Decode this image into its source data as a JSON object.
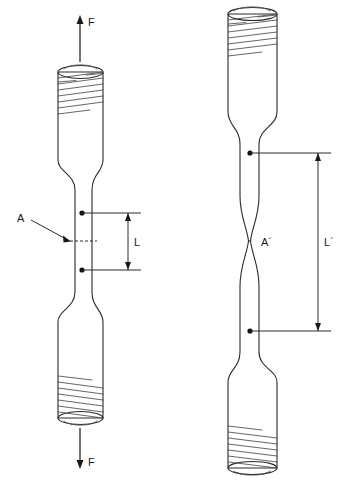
{
  "figure": {
    "background_color": "#ffffff",
    "line_color": "#2b2b2b",
    "width": 347,
    "height": 493
  },
  "specimen_left": {
    "name": "undeformed-specimen",
    "state": "original",
    "force_top_label": "F",
    "force_bottom_label": "F",
    "area_label": "A",
    "gauge_length_label": "L",
    "notes": "threaded ends top and bottom, uniform straight gauge section"
  },
  "specimen_right": {
    "name": "deformed-specimen",
    "state": "elongated-necked",
    "area_label": "A´",
    "gauge_length_label": "L´",
    "notes": "threaded ends top and bottom, necked down at mid gauge section"
  },
  "labels": {
    "force_top": "F",
    "force_bottom": "F",
    "area_original": "A",
    "area_final": "A´",
    "length_original": "L",
    "length_final": "L´"
  }
}
